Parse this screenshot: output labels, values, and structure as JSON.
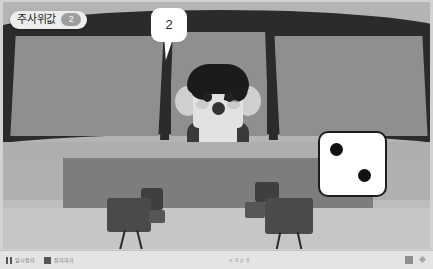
{
  "stage": {
    "badge": {
      "label": "주사위값",
      "value": "2"
    },
    "speech_bubble": {
      "text": "2"
    },
    "dice": {
      "name": "dice-sprite",
      "value": 2,
      "pips": 2,
      "face_color": "#ffffff",
      "pip_color": "#111111",
      "border_color": "#1d1d1d"
    },
    "character": {
      "name": "news-anchor",
      "hair_color": "#1b1b1b",
      "skin_color": "#e2e2e2",
      "body_color": "#3a3a3a"
    },
    "scene": {
      "name": "news-studio",
      "wall_color": "#b4b4b4",
      "frame_color": "#2b2b2b",
      "pane_color": "#8f8f8f",
      "desk_color": "#7d7d7d",
      "floor_color": "#c6c6c6",
      "camera_color": "#4a4a4a"
    }
  },
  "toolbar": {
    "pause_label": "일시정지",
    "stop_label": "정지하기",
    "coordinates": "x: 0 y: 0",
    "grid_icon": "grid-icon",
    "fullscreen_icon": "fullscreen-icon"
  }
}
